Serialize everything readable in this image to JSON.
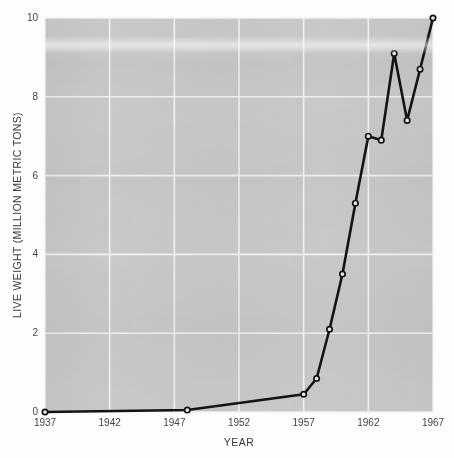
{
  "chart_data": {
    "type": "line",
    "title": "",
    "xlabel": "YEAR",
    "ylabel": "LIVE WEIGHT (MILLION METRIC TONS)",
    "xlim": [
      1937,
      1967
    ],
    "ylim": [
      0,
      10
    ],
    "xticks": [
      "1937",
      "1942",
      "1947",
      "1952",
      "1957",
      "1962",
      "1967"
    ],
    "xtick_values": [
      1937,
      1942,
      1947,
      1952,
      1957,
      1962,
      1967
    ],
    "yticks": [
      "0",
      "2",
      "4",
      "6",
      "8",
      "10"
    ],
    "ytick_values": [
      0,
      2,
      4,
      6,
      8,
      10
    ],
    "grid": true,
    "legend": "none",
    "marker": "open-circle",
    "line_color": "#141414",
    "plot_background": "#c9c9c9",
    "grid_color": "#f2f2f2",
    "x": [
      1937,
      1948,
      1957,
      1958,
      1959,
      1960,
      1961,
      1962,
      1963,
      1964,
      1965,
      1966,
      1967
    ],
    "values": [
      0.0,
      0.05,
      0.45,
      0.85,
      2.1,
      3.5,
      5.3,
      7.0,
      6.9,
      9.1,
      7.4,
      8.7,
      10.0
    ],
    "series": [
      {
        "name": "live weight",
        "points": [
          {
            "year": 1937,
            "value": 0.0
          },
          {
            "year": 1948,
            "value": 0.05
          },
          {
            "year": 1957,
            "value": 0.45
          },
          {
            "year": 1958,
            "value": 0.85
          },
          {
            "year": 1959,
            "value": 2.1
          },
          {
            "year": 1960,
            "value": 3.5
          },
          {
            "year": 1961,
            "value": 5.3
          },
          {
            "year": 1962,
            "value": 7.0
          },
          {
            "year": 1963,
            "value": 6.9
          },
          {
            "year": 1964,
            "value": 9.1
          },
          {
            "year": 1965,
            "value": 7.4
          },
          {
            "year": 1966,
            "value": 8.7
          },
          {
            "year": 1967,
            "value": 10.0
          }
        ]
      }
    ]
  }
}
